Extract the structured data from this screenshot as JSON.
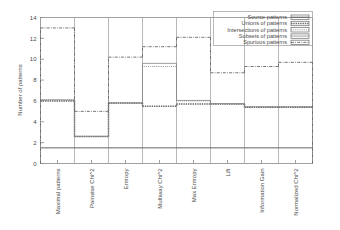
{
  "chart_data": {
    "type": "bar",
    "title": "",
    "xlabel": "",
    "ylabel": "Number of patterns",
    "ylim": [
      0,
      14
    ],
    "yticks": [
      0,
      2,
      4,
      6,
      8,
      10,
      12,
      14
    ],
    "grid": false,
    "legend_position": "top-right",
    "categories": [
      "Maximal patterns",
      "Pairwise Chi^2",
      "Entropy",
      "Multiway Chi^2",
      "Max Entropy",
      "Lift",
      "Information Gain",
      "Normalized Chi^2"
    ],
    "series": [
      {
        "name": "Source patterns",
        "values": [
          1.5,
          1.5,
          1.5,
          1.5,
          1.5,
          1.5,
          1.5,
          1.5
        ]
      },
      {
        "name": "Unions of patterns",
        "values": [
          6.0,
          2.6,
          5.8,
          5.5,
          5.7,
          5.7,
          5.4,
          5.4
        ]
      },
      {
        "name": "Intersections of patterns",
        "values": [
          6.1,
          2.6,
          5.8,
          9.3,
          6.0,
          5.7,
          5.4,
          5.4
        ]
      },
      {
        "name": "Subsets of patterns",
        "values": [
          6.1,
          2.6,
          5.8,
          9.6,
          6.05,
          5.75,
          5.45,
          5.45
        ]
      },
      {
        "name": "Spurious patterns",
        "values": [
          13.0,
          5.0,
          10.2,
          11.2,
          12.1,
          8.7,
          9.3,
          9.7
        ]
      }
    ]
  },
  "legend": {
    "entries": [
      {
        "label": "Source patterns",
        "key": "solid-line-key"
      },
      {
        "label": "Unions of patterns",
        "key": "dashed-line-key"
      },
      {
        "label": "Intersections of patterns",
        "key": "dotted-line-key"
      },
      {
        "label": "Subsets of patterns",
        "key": "thin-line-key"
      },
      {
        "label": "Spurious patterns",
        "key": "dashdot-line-key"
      }
    ]
  },
  "axes": {
    "y_title": "Number of patterns",
    "y_tick_labels": [
      "0",
      "2",
      "4",
      "6",
      "8",
      "10",
      "12",
      "14"
    ],
    "x_tick_labels": [
      "Maximal patterns",
      "Pairwise Chi^2",
      "Entropy",
      "Multiway Chi^2",
      "Max Entropy",
      "Lift",
      "Information Gain",
      "Normalized Chi^2"
    ]
  }
}
